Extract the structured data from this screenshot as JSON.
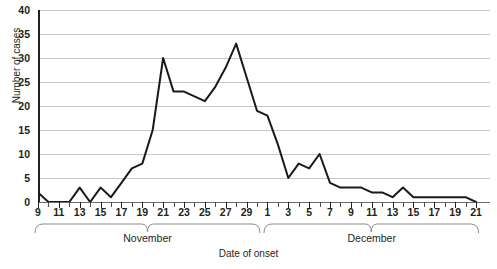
{
  "chart_data": {
    "type": "line",
    "title": "",
    "xlabel": "Date of onset",
    "ylabel": "Number of cases",
    "ylim": [
      0,
      40
    ],
    "ytick_values": [
      0,
      5,
      10,
      15,
      20,
      25,
      30,
      35,
      40
    ],
    "grid": true,
    "legend": null,
    "line_color": "#1a1a1a",
    "grid_color": "#c9c9c9",
    "axis_color": "#231f20",
    "x": [
      "Nov 9",
      "Nov 10",
      "Nov 11",
      "Nov 12",
      "Nov 13",
      "Nov 14",
      "Nov 15",
      "Nov 16",
      "Nov 17",
      "Nov 18",
      "Nov 19",
      "Nov 20",
      "Nov 21",
      "Nov 22",
      "Nov 23",
      "Nov 24",
      "Nov 25",
      "Nov 26",
      "Nov 27",
      "Nov 28",
      "Nov 29",
      "Nov 30",
      "Dec 1",
      "Dec 2",
      "Dec 3",
      "Dec 4",
      "Dec 5",
      "Dec 6",
      "Dec 7",
      "Dec 8",
      "Dec 9",
      "Dec 10",
      "Dec 11",
      "Dec 12",
      "Dec 13",
      "Dec 14",
      "Dec 15",
      "Dec 16",
      "Dec 17",
      "Dec 18",
      "Dec 19",
      "Dec 20",
      "Dec 21"
    ],
    "values": [
      2,
      0,
      0,
      0,
      3,
      0,
      3,
      1,
      4,
      7,
      8,
      15,
      30,
      23,
      23,
      22,
      21,
      24,
      28,
      33,
      26,
      19,
      18,
      12,
      5,
      8,
      7,
      10,
      4,
      3,
      3,
      3,
      2,
      2,
      1,
      3,
      1,
      1,
      1,
      1,
      1,
      1,
      0
    ],
    "x_major_ticklabels": [
      {
        "x": "Nov 9",
        "label": "9"
      },
      {
        "x": "Nov 11",
        "label": "11"
      },
      {
        "x": "Nov 13",
        "label": "13"
      },
      {
        "x": "Nov 15",
        "label": "15"
      },
      {
        "x": "Nov 17",
        "label": "17"
      },
      {
        "x": "Nov 19",
        "label": "19"
      },
      {
        "x": "Nov 21",
        "label": "21"
      },
      {
        "x": "Nov 23",
        "label": "23"
      },
      {
        "x": "Nov 25",
        "label": "25"
      },
      {
        "x": "Nov 27",
        "label": "27"
      },
      {
        "x": "Nov 29",
        "label": "29"
      },
      {
        "x": "Dec 1",
        "label": "1"
      },
      {
        "x": "Dec 3",
        "label": "3"
      },
      {
        "x": "Dec 5",
        "label": "5"
      },
      {
        "x": "Dec 7",
        "label": "7"
      },
      {
        "x": "Dec 9",
        "label": "9"
      },
      {
        "x": "Dec 11",
        "label": "11"
      },
      {
        "x": "Dec 13",
        "label": "13"
      },
      {
        "x": "Dec 15",
        "label": "15"
      },
      {
        "x": "Dec 17",
        "label": "17"
      },
      {
        "x": "Dec 19",
        "label": "19"
      },
      {
        "x": "Dec 21",
        "label": "21"
      }
    ],
    "month_groups": [
      {
        "label": "November",
        "start": "Nov 9",
        "end": "Nov 30"
      },
      {
        "label": "December",
        "start": "Dec 1",
        "end": "Dec 21"
      }
    ]
  }
}
